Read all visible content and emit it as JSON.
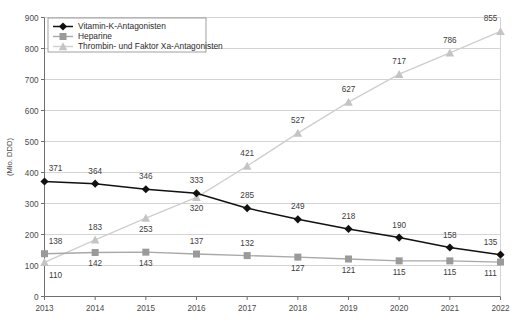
{
  "chart_data": {
    "type": "line",
    "title": "",
    "xlabel": "",
    "ylabel": "(Mio. DDD)",
    "categories": [
      "2013",
      "2014",
      "2015",
      "2016",
      "2017",
      "2018",
      "2019",
      "2020",
      "2021",
      "2022"
    ],
    "x": [
      2013,
      2014,
      2015,
      2016,
      2017,
      2018,
      2019,
      2020,
      2021,
      2022
    ],
    "xlim": [
      2013,
      2022
    ],
    "ylim": [
      0,
      900
    ],
    "yticks": [
      0,
      100,
      200,
      300,
      400,
      500,
      600,
      700,
      800,
      900
    ],
    "ytick_labels": [
      "0",
      "100",
      "200",
      "300",
      "400",
      "500",
      "600",
      "700",
      "800",
      "900"
    ],
    "grid": true,
    "legend_position": "top-left",
    "series": [
      {
        "name": "Vitamin-K-Antagonisten",
        "key": "vka",
        "marker": "diamond",
        "color": "#111111",
        "values": [
          371,
          364,
          346,
          333,
          285,
          249,
          218,
          190,
          158,
          135
        ],
        "label_offsets_y": [
          -10,
          -10,
          -10,
          -10,
          -10,
          -10,
          -10,
          -10,
          -10,
          -10
        ]
      },
      {
        "name": "Heparine",
        "key": "hep",
        "marker": "square",
        "color": "#9a9a9a",
        "values": [
          138,
          142,
          143,
          137,
          132,
          127,
          121,
          115,
          115,
          111
        ],
        "label_offsets_y": [
          -10,
          14,
          14,
          -10,
          -10,
          14,
          14,
          14,
          14,
          14
        ]
      },
      {
        "name": "Thrombin- und Faktor Xa-Antagonisten",
        "key": "thr",
        "marker": "triangle",
        "color": "#c4c4c4",
        "values": [
          110,
          183,
          253,
          320,
          421,
          527,
          627,
          717,
          786,
          855
        ],
        "label_offsets_y": [
          16,
          -10,
          14,
          14,
          -10,
          -10,
          -10,
          -10,
          -10,
          -10
        ]
      }
    ]
  },
  "legend": {
    "items": [
      {
        "label": "Vitamin-K-Antagonisten"
      },
      {
        "label": "Heparine"
      },
      {
        "label": "Thrombin- und Faktor Xa-Antagonisten"
      }
    ]
  },
  "axes": {
    "y_title": "(Mio. DDD)"
  }
}
